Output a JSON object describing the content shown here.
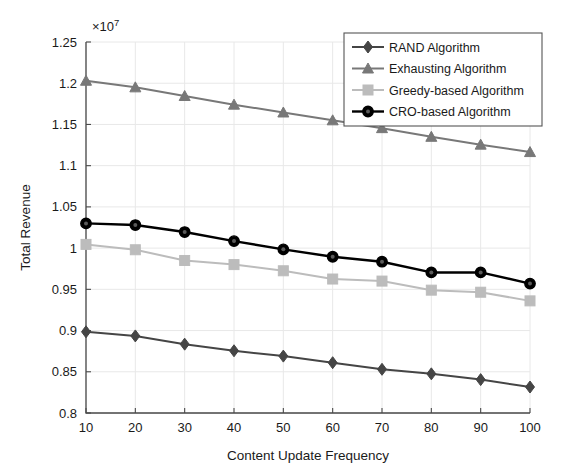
{
  "chart_data": {
    "type": "line",
    "title": "",
    "xlabel": "Content Update Frequency",
    "ylabel": "Total Revenue",
    "y_exponent_label": "×10",
    "y_exponent_power": "7",
    "x": [
      10,
      20,
      30,
      40,
      50,
      60,
      70,
      80,
      90,
      100
    ],
    "xlim": [
      10,
      100
    ],
    "ylim": [
      0.8,
      1.25
    ],
    "y_tick_labels": [
      "0.8",
      "0.85",
      "0.9",
      "0.95",
      "1",
      "1.05",
      "1.1",
      "1.15",
      "1.2",
      "1.25"
    ],
    "y_tick_values": [
      0.8,
      0.85,
      0.9,
      0.95,
      1.0,
      1.05,
      1.1,
      1.15,
      1.2,
      1.25
    ],
    "x_tick_labels": [
      "10",
      "20",
      "30",
      "40",
      "50",
      "60",
      "70",
      "80",
      "90",
      "100"
    ],
    "grid": true,
    "legend_position": "top-right",
    "series": [
      {
        "name": "RAND Algorithm",
        "marker": "diamond",
        "color": "#454545",
        "values": [
          0.8985,
          0.8935,
          0.8835,
          0.8755,
          0.869,
          0.861,
          0.853,
          0.8475,
          0.8405,
          0.8315
        ]
      },
      {
        "name": "Exhausting Algorithm",
        "marker": "triangle",
        "color": "#787878",
        "values": [
          1.203,
          1.195,
          1.1845,
          1.174,
          1.1645,
          1.155,
          1.1455,
          1.135,
          1.1255,
          1.1165
        ]
      },
      {
        "name": "Greedy-based Algorithm",
        "marker": "square",
        "color": "#bcbcbc",
        "values": [
          1.0045,
          0.998,
          0.985,
          0.98,
          0.9725,
          0.9625,
          0.96,
          0.949,
          0.9465,
          0.936
        ]
      },
      {
        "name": "CRO-based Algorithm",
        "marker": "circle",
        "color": "#000000",
        "values": [
          1.03,
          1.028,
          1.0195,
          1.0085,
          0.9985,
          0.9895,
          0.9835,
          0.9705,
          0.9705,
          0.957
        ]
      }
    ]
  },
  "legend": {
    "entries": [
      {
        "label": "RAND Algorithm"
      },
      {
        "label": "Exhausting Algorithm"
      },
      {
        "label": "Greedy-based Algorithm"
      },
      {
        "label": "CRO-based Algorithm"
      }
    ]
  }
}
